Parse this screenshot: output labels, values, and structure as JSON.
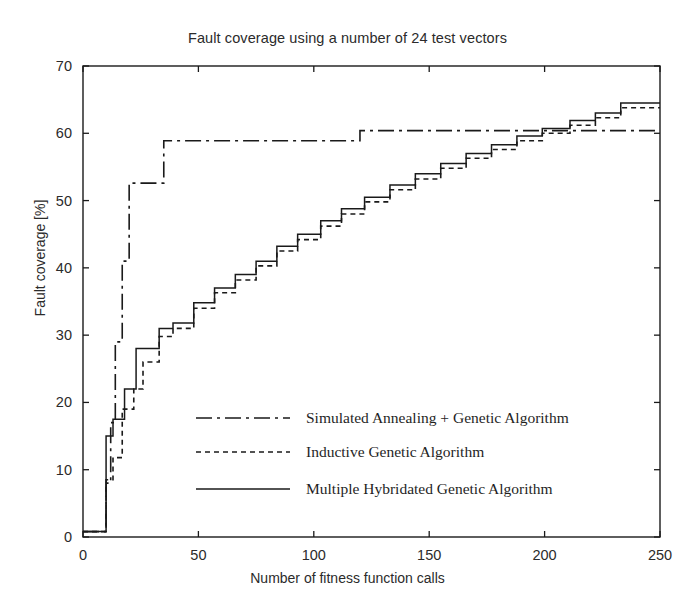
{
  "chart_data": {
    "type": "line",
    "title": "Fault coverage using a number of 24 test vectors",
    "xlabel": "Number of fitness function calls",
    "ylabel": "Fault coverage  [%]",
    "xlim": [
      0,
      250
    ],
    "ylim": [
      0,
      70
    ],
    "xticks": [
      0,
      50,
      100,
      150,
      200,
      250
    ],
    "yticks": [
      0,
      10,
      20,
      30,
      40,
      50,
      60,
      70
    ],
    "xticklabels": [
      "0",
      "50",
      "100",
      "150",
      "200",
      "250"
    ],
    "yticklabels": [
      "0",
      "10",
      "20",
      "30",
      "40",
      "50",
      "60",
      "70"
    ],
    "grid": false,
    "legend_position": "center",
    "drawstyle": "steps-post",
    "series": [
      {
        "name": "Simulated Annealing + Genetic Algorithm",
        "style": "dash-dot",
        "x": [
          0,
          8,
          10,
          12,
          14,
          17,
          20,
          35,
          120,
          250
        ],
        "values": [
          0.8,
          0.8,
          8.0,
          17.0,
          29.0,
          41.0,
          52.6,
          58.9,
          60.4,
          60.4
        ]
      },
      {
        "name": "Inductive Genetic Algorithm",
        "style": "dotted",
        "x": [
          0,
          8,
          10,
          13,
          17,
          22,
          26,
          33,
          39,
          48,
          57,
          66,
          75,
          84,
          93,
          103,
          112,
          122,
          133,
          144,
          155,
          166,
          177,
          188,
          199,
          211,
          222,
          233,
          250
        ],
        "values": [
          0.8,
          0.8,
          8.5,
          11.8,
          19.0,
          22.0,
          26.0,
          29.8,
          31.0,
          34.0,
          36.3,
          38.2,
          40.3,
          42.5,
          44.2,
          46.2,
          48.0,
          49.8,
          51.6,
          53.2,
          54.8,
          56.3,
          57.6,
          58.9,
          60.0,
          61.2,
          62.3,
          63.8,
          63.8
        ]
      },
      {
        "name": "Multiple Hybridated Genetic Algorithm",
        "style": "solid",
        "x": [
          0,
          8,
          10,
          13,
          18,
          23,
          26,
          33,
          39,
          48,
          57,
          66,
          75,
          84,
          93,
          103,
          112,
          122,
          133,
          144,
          155,
          166,
          177,
          188,
          199,
          211,
          222,
          233,
          250
        ],
        "values": [
          0.8,
          0.8,
          15.0,
          17.5,
          22.0,
          28.0,
          28.0,
          31.0,
          31.8,
          34.8,
          37.0,
          39.0,
          41.0,
          43.2,
          45.0,
          47.0,
          48.8,
          50.5,
          52.3,
          54.0,
          55.5,
          57.0,
          58.3,
          59.6,
          60.7,
          61.9,
          63.0,
          64.5,
          64.5
        ]
      }
    ],
    "legend": [
      {
        "label": "Simulated Annealing + Genetic Algorithm",
        "style": "dash-dot"
      },
      {
        "label": "Inductive Genetic Algorithm",
        "style": "dotted"
      },
      {
        "label": "Multiple Hybridated Genetic Algorithm",
        "style": "solid"
      }
    ],
    "colors": {
      "line": "#1a1a1a",
      "axis": "#1a1a1a",
      "background": "#ffffff"
    }
  }
}
